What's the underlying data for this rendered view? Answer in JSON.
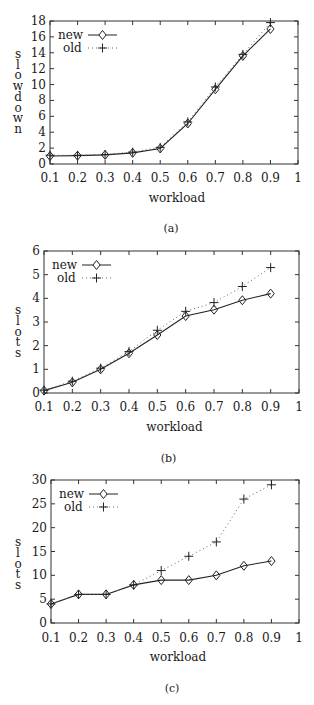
{
  "chart_data": [
    {
      "id": "a",
      "type": "line",
      "caption": "(a)",
      "title": "",
      "xlabel": "workload",
      "ylabel": "slowdown",
      "xlim": [
        0.1,
        1
      ],
      "ylim": [
        0,
        18
      ],
      "x_ticks": [
        0.1,
        0.2,
        0.3,
        0.4,
        0.5,
        0.6,
        0.7,
        0.8,
        0.9,
        1
      ],
      "x_tick_labels": [
        "0.1",
        "0.2",
        "0.3",
        "0.4",
        "0.5",
        "0.6",
        "0.7",
        "0.8",
        "0.9",
        "1"
      ],
      "y_ticks": [
        0,
        2,
        4,
        6,
        8,
        10,
        12,
        14,
        16,
        18
      ],
      "y_tick_labels": [
        "0",
        "2",
        "4",
        "6",
        "8",
        "10",
        "12",
        "14",
        "16",
        "18"
      ],
      "grid": false,
      "legend_position": "upper left",
      "x": [
        0.1,
        0.2,
        0.3,
        0.4,
        0.5,
        0.6,
        0.7,
        0.8,
        0.9
      ],
      "series": [
        {
          "name": "new",
          "style": "solid",
          "marker": "diamond",
          "values": [
            1.0,
            1.05,
            1.15,
            1.4,
            1.95,
            5.1,
            9.4,
            13.6,
            17.0
          ]
        },
        {
          "name": "old",
          "style": "dotted",
          "marker": "plus",
          "values": [
            1.1,
            1.1,
            1.2,
            1.5,
            2.1,
            5.3,
            9.7,
            13.8,
            17.8
          ]
        }
      ]
    },
    {
      "id": "b",
      "type": "line",
      "caption": "(b)",
      "title": "",
      "xlabel": "workload",
      "ylabel": "slots",
      "xlim": [
        0.1,
        1
      ],
      "ylim": [
        0,
        6
      ],
      "x_ticks": [
        0.1,
        0.2,
        0.3,
        0.4,
        0.5,
        0.6,
        0.7,
        0.8,
        0.9,
        1
      ],
      "x_tick_labels": [
        "0.1",
        "0.2",
        "0.3",
        "0.4",
        "0.5",
        "0.6",
        "0.7",
        "0.8",
        "0.9",
        "1"
      ],
      "y_ticks": [
        0,
        1,
        2,
        3,
        4,
        5,
        6
      ],
      "y_tick_labels": [
        "0",
        "1",
        "2",
        "3",
        "4",
        "5",
        "6"
      ],
      "grid": false,
      "legend_position": "upper left",
      "x": [
        0.1,
        0.2,
        0.3,
        0.4,
        0.5,
        0.6,
        0.7,
        0.8,
        0.9
      ],
      "series": [
        {
          "name": "new",
          "style": "solid",
          "marker": "diamond",
          "values": [
            0.1,
            0.45,
            1.0,
            1.68,
            2.45,
            3.25,
            3.52,
            3.92,
            4.2
          ]
        },
        {
          "name": "old",
          "style": "dotted",
          "marker": "plus",
          "values": [
            0.12,
            0.5,
            1.05,
            1.75,
            2.65,
            3.45,
            3.82,
            4.5,
            5.3
          ]
        }
      ]
    },
    {
      "id": "c",
      "type": "line",
      "caption": "(c)",
      "title": "",
      "xlabel": "workload",
      "ylabel": "slots",
      "xlim": [
        0.1,
        1
      ],
      "ylim": [
        0,
        30
      ],
      "x_ticks": [
        0.1,
        0.2,
        0.3,
        0.4,
        0.5,
        0.6,
        0.7,
        0.8,
        0.9,
        1
      ],
      "x_tick_labels": [
        "0.1",
        "0.2",
        "0.3",
        "0.4",
        "0.5",
        "0.6",
        "0.7",
        "0.8",
        "0.9",
        "1"
      ],
      "y_ticks": [
        0,
        5,
        10,
        15,
        20,
        25,
        30
      ],
      "y_tick_labels": [
        "0",
        "5",
        "10",
        "15",
        "20",
        "25",
        "30"
      ],
      "grid": false,
      "legend_position": "upper left",
      "x": [
        0.1,
        0.2,
        0.3,
        0.4,
        0.5,
        0.6,
        0.7,
        0.8,
        0.9
      ],
      "series": [
        {
          "name": "new",
          "style": "solid",
          "marker": "diamond",
          "values": [
            4,
            6,
            6,
            8,
            9,
            9,
            10,
            12,
            13
          ]
        },
        {
          "name": "old",
          "style": "dotted",
          "marker": "plus",
          "values": [
            4,
            6,
            6,
            8,
            11,
            14,
            17,
            26,
            29
          ]
        }
      ]
    }
  ],
  "layout": {
    "panels": [
      {
        "left": 50,
        "right": 298,
        "top": 21,
        "bottom": 164,
        "tick_label_y": 182,
        "xlabel_y": 202,
        "caption_y": 232,
        "ylabel_x": 18,
        "ylabel_top": 58,
        "ylabel_step": 10.7
      },
      {
        "left": 44,
        "right": 299,
        "top": 251,
        "bottom": 393,
        "tick_label_y": 411,
        "xlabel_y": 431,
        "caption_y": 462,
        "ylabel_x": 18,
        "ylabel_top": 314,
        "ylabel_step": 10.8
      },
      {
        "left": 51,
        "right": 299,
        "top": 480,
        "bottom": 623,
        "tick_label_y": 642,
        "xlabel_y": 661,
        "caption_y": 692,
        "ylabel_x": 18,
        "ylabel_top": 546,
        "ylabel_step": 10.8
      }
    ],
    "colors": {
      "axis": "#333333",
      "new_line": "#222222",
      "old_line": "#666666",
      "text": "#1a1a1a"
    }
  }
}
